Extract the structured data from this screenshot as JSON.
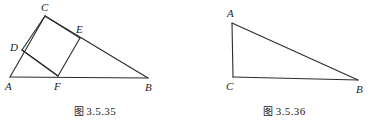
{
  "page": {
    "width": 379,
    "height": 126,
    "background": "#ffffff",
    "ink_color": "#2b2b2b",
    "label_color": "#1c1c1c"
  },
  "figures": [
    {
      "id": "figure-3-5-35",
      "caption_prefix": "图",
      "caption_number": "3.5.35",
      "caption_full": "图 3.5.35",
      "description": "triangle-with-inscribed-square",
      "vertices": [
        {
          "label": "A",
          "x": 10,
          "y": 77,
          "label_x": 5,
          "label_y": 81
        },
        {
          "label": "B",
          "x": 148,
          "y": 78,
          "label_x": 145,
          "label_y": 82
        },
        {
          "label": "C",
          "x": 45,
          "y": 16,
          "label_x": 41,
          "label_y": 2
        },
        {
          "label": "D",
          "x": 22,
          "y": 50,
          "label_x": 10,
          "label_y": 42
        },
        {
          "label": "E",
          "x": 80,
          "y": 38,
          "label_x": 76,
          "label_y": 24
        },
        {
          "label": "F",
          "x": 58,
          "y": 76,
          "label_x": 54,
          "label_y": 81
        }
      ],
      "segments": [
        {
          "name": "side-AB",
          "from": "A",
          "to": "B"
        },
        {
          "name": "side-AC",
          "from": "A",
          "to": "C"
        },
        {
          "name": "side-CB",
          "from": "C",
          "to": "B"
        },
        {
          "name": "square-side-DC",
          "from": "D",
          "to": "C"
        },
        {
          "name": "square-side-CE",
          "from": "C",
          "to": "E"
        },
        {
          "name": "square-side-EF",
          "from": "E",
          "to": "F"
        },
        {
          "name": "square-side-FD",
          "from": "F",
          "to": "D"
        },
        {
          "name": "diagonal-DF-to-B",
          "from": "D",
          "to": "F"
        }
      ]
    },
    {
      "id": "figure-3-5-36",
      "caption_prefix": "图",
      "caption_number": "3.5.36",
      "caption_full": "图 3.5.36",
      "description": "scalene-triangle",
      "vertices": [
        {
          "label": "A",
          "x": 42,
          "y": 23,
          "label_x": 37,
          "label_y": 8
        },
        {
          "label": "C",
          "x": 43,
          "y": 77,
          "label_x": 36,
          "label_y": 81
        },
        {
          "label": "B",
          "x": 168,
          "y": 80,
          "label_x": 166,
          "label_y": 84
        }
      ],
      "segments": [
        {
          "name": "side-AC",
          "from": "A",
          "to": "C"
        },
        {
          "name": "side-AB",
          "from": "A",
          "to": "B"
        },
        {
          "name": "side-CB",
          "from": "C",
          "to": "B"
        }
      ]
    }
  ],
  "caption_y": 103
}
